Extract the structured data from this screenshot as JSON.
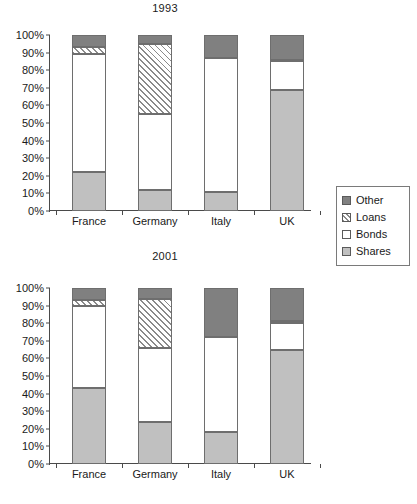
{
  "chart_data": [
    {
      "type": "bar",
      "title": "1993",
      "xlabel": "",
      "ylabel": "",
      "ylim": [
        0,
        100
      ],
      "ytick_labels": [
        "0%",
        "10%",
        "20%",
        "30%",
        "40%",
        "50%",
        "60%",
        "70%",
        "80%",
        "90%",
        "100%"
      ],
      "ytick_values": [
        0,
        10,
        20,
        30,
        40,
        50,
        60,
        70,
        80,
        90,
        100
      ],
      "grid": false,
      "stacked": true,
      "legend_position": "right",
      "categories": [
        "France",
        "Germany",
        "Italy",
        "UK"
      ],
      "series": [
        {
          "name": "Shares",
          "values": [
            22,
            12,
            11,
            69
          ]
        },
        {
          "name": "Bonds",
          "values": [
            67,
            43,
            76,
            16
          ]
        },
        {
          "name": "Loans",
          "values": [
            4,
            40,
            0,
            1
          ]
        },
        {
          "name": "Other",
          "values": [
            7,
            5,
            13,
            14
          ]
        }
      ]
    },
    {
      "type": "bar",
      "title": "2001",
      "xlabel": "",
      "ylabel": "",
      "ylim": [
        0,
        100
      ],
      "ytick_labels": [
        "0%",
        "10%",
        "20%",
        "30%",
        "40%",
        "50%",
        "60%",
        "70%",
        "80%",
        "90%",
        "100%"
      ],
      "ytick_values": [
        0,
        10,
        20,
        30,
        40,
        50,
        60,
        70,
        80,
        90,
        100
      ],
      "grid": false,
      "stacked": true,
      "legend_position": "right",
      "categories": [
        "France",
        "Germany",
        "Italy",
        "UK"
      ],
      "series": [
        {
          "name": "Shares",
          "values": [
            43,
            24,
            18,
            65
          ]
        },
        {
          "name": "Bonds",
          "values": [
            47,
            42,
            54,
            15
          ]
        },
        {
          "name": "Loans",
          "values": [
            3,
            28,
            0,
            1
          ]
        },
        {
          "name": "Other",
          "values": [
            7,
            6,
            28,
            19
          ]
        }
      ]
    }
  ],
  "legend": {
    "items": [
      {
        "label": "Other",
        "fill": "#808080"
      },
      {
        "label": "Loans",
        "fill": "hatch"
      },
      {
        "label": "Bonds",
        "fill": "#ffffff"
      },
      {
        "label": "Shares",
        "fill": "#c0c0c0"
      }
    ]
  },
  "colors": {
    "shares": "#c0c0c0",
    "bonds": "#ffffff",
    "other": "#808080",
    "outline": "#6e6e6e",
    "axis": "#4a4a4a",
    "text": "#1a1a1a"
  }
}
